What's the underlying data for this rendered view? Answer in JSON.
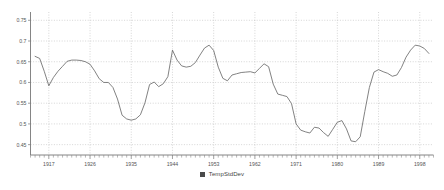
{
  "chart_data": {
    "type": "line",
    "title": "",
    "xlabel": "",
    "ylabel": "",
    "ylim": [
      0.425,
      0.77
    ],
    "xlim": [
      1913,
      2001
    ],
    "grid": true,
    "legend_position": "bottom-center",
    "yticks": [
      "0.75",
      "0.7",
      "0.65",
      "0.6",
      "0.55",
      "0.5",
      "0.45"
    ],
    "ytick_values": [
      0.75,
      0.7,
      0.65,
      0.6,
      0.55,
      0.5,
      0.45
    ],
    "xticks": [
      "1917",
      "1926",
      "1935",
      "1944",
      "1953",
      "1962",
      "1971",
      "1980",
      "1989",
      "1998"
    ],
    "xtick_values": [
      1917,
      1926,
      1935,
      1944,
      1953,
      1962,
      1971,
      1980,
      1989,
      1998
    ],
    "series": [
      {
        "name": "TempStdDev",
        "color": "#6b6b6b",
        "x": [
          1914,
          1915,
          1916,
          1917,
          1918,
          1919,
          1920,
          1921,
          1922,
          1923,
          1924,
          1925,
          1926,
          1927,
          1928,
          1929,
          1930,
          1931,
          1932,
          1933,
          1934,
          1935,
          1936,
          1937,
          1938,
          1939,
          1940,
          1941,
          1942,
          1943,
          1944,
          1945,
          1946,
          1947,
          1948,
          1949,
          1950,
          1951,
          1952,
          1953,
          1954,
          1955,
          1956,
          1957,
          1958,
          1959,
          1960,
          1961,
          1962,
          1963,
          1964,
          1965,
          1966,
          1967,
          1968,
          1969,
          1970,
          1971,
          1972,
          1973,
          1974,
          1975,
          1976,
          1977,
          1978,
          1979,
          1980,
          1981,
          1982,
          1983,
          1984,
          1985,
          1986,
          1987,
          1988,
          1989,
          1990,
          1991,
          1992,
          1993,
          1994,
          1995,
          1996,
          1997,
          1998,
          1999,
          2000
        ],
        "y": [
          0.663,
          0.658,
          0.627,
          0.592,
          0.612,
          0.627,
          0.639,
          0.651,
          0.654,
          0.654,
          0.653,
          0.65,
          0.644,
          0.628,
          0.609,
          0.6,
          0.6,
          0.588,
          0.56,
          0.521,
          0.512,
          0.509,
          0.512,
          0.522,
          0.551,
          0.595,
          0.601,
          0.59,
          0.597,
          0.614,
          0.678,
          0.654,
          0.64,
          0.637,
          0.639,
          0.648,
          0.666,
          0.683,
          0.69,
          0.677,
          0.637,
          0.61,
          0.604,
          0.618,
          0.621,
          0.624,
          0.625,
          0.626,
          0.623,
          0.634,
          0.645,
          0.638,
          0.596,
          0.572,
          0.569,
          0.566,
          0.549,
          0.5,
          0.485,
          0.481,
          0.478,
          0.492,
          0.49,
          0.479,
          0.47,
          0.487,
          0.504,
          0.508,
          0.488,
          0.459,
          0.457,
          0.469,
          0.53,
          0.588,
          0.625,
          0.631,
          0.626,
          0.622,
          0.615,
          0.618,
          0.636,
          0.661,
          0.678,
          0.69,
          0.688,
          0.682,
          0.67
        ]
      }
    ],
    "legend": [
      {
        "label": "TempStdDev",
        "color": "#4a4a4a",
        "marker": "square"
      }
    ]
  },
  "legend": {
    "label": "TempStdDev"
  },
  "icons": {
    "legend_swatch": "square-swatch-icon"
  }
}
